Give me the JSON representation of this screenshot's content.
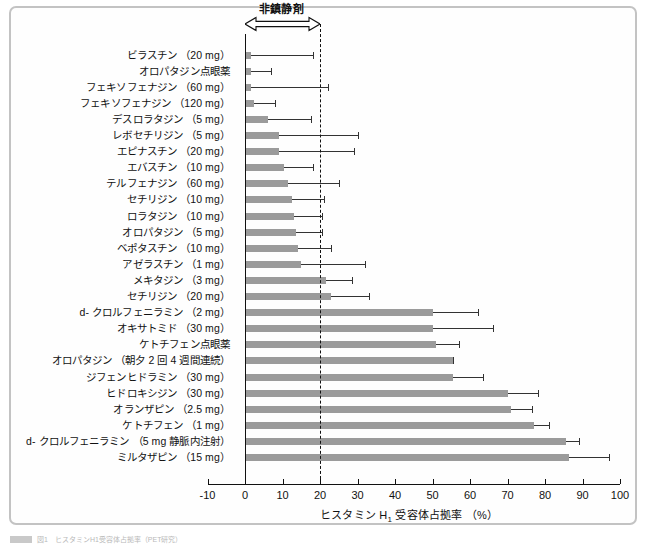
{
  "figure": {
    "arrow_label": "非鎮静剤",
    "xaxis_title_main": "ヒスタミン H",
    "xaxis_title_sub": "1",
    "xaxis_title_rest": " 受容体占拠率 （%）",
    "caption": "図1　ヒスタミンH1受容体占拠率（PET研究）",
    "bar_color": "#9b9b9b",
    "error_color": "#333333",
    "threshold_value": 20
  },
  "chart_data": {
    "type": "bar",
    "orientation": "horizontal",
    "title": "ヒスタミン H1 受容体占拠率 （%）",
    "xlabel": "ヒスタミン H1 受容体占拠率 （%）",
    "ylabel": "",
    "xlim": [
      -10,
      100
    ],
    "xticks": [
      -10,
      0,
      10,
      20,
      30,
      40,
      50,
      60,
      70,
      80,
      90,
      100
    ],
    "xticklabels": [
      "-10",
      "0",
      "10",
      "20",
      "30",
      "40",
      "50",
      "60",
      "70",
      "80",
      "90",
      "100"
    ],
    "grid": false,
    "legend": false,
    "annotations": [
      {
        "text": "非鎮静剤",
        "type": "double-arrow",
        "x_from": 0,
        "x_to": 20
      },
      {
        "text": "threshold",
        "type": "dashed-vline",
        "x": 20
      }
    ],
    "categories": [
      "ビラスチン （20 mg）",
      "オロパタジン点眼薬",
      "フェキソフェナジン （60 mg）",
      "フェキソフェナジン （120 mg）",
      "デスロラタジン （5 mg）",
      "レボセチリジン （5 mg）",
      "エピナスチン （20 mg）",
      "エバスチン （10 mg）",
      "テルフェナジン （60 mg）",
      "セチリジン （10 mg）",
      "ロラタジン （10 mg）",
      "オロパタジン （5 mg）",
      "ベポタスチン （10 mg）",
      "アゼラスチン （1 mg）",
      "メキタジン （3 mg）",
      "セチリジン （20 mg）",
      "d- クロルフェニラミン （2 mg）",
      "オキサトミド （30 mg）",
      "ケトチフェン点眼薬",
      "オロパタジン （朝夕 2 回 4 週間連続）",
      "ジフェンヒドラミン （30 mg）",
      "ヒドロキシジン （30 mg）",
      "オランザピン （2.5 mg）",
      "ケトチフェン （1 mg）",
      "d- クロルフェニラミン （5 mg 静脈内注射）",
      "ミルタザピン （15 mg）"
    ],
    "values": [
      1.5,
      1.5,
      1.5,
      2.5,
      6.0,
      9.0,
      9.0,
      10.5,
      11.5,
      12.5,
      13.0,
      13.5,
      14.0,
      15.0,
      21.5,
      23.0,
      50.0,
      50.0,
      51.0,
      55.5,
      55.5,
      70.0,
      71.0,
      77.0,
      85.5,
      86.5
    ],
    "errors_upper": [
      18.0,
      7.0,
      22.0,
      8.0,
      17.5,
      30.0,
      29.0,
      18.0,
      25.0,
      21.0,
      20.5,
      20.5,
      23.0,
      32.0,
      28.5,
      33.0,
      62.0,
      66.0,
      57.0,
      55.5,
      63.5,
      78.0,
      76.5,
      81.0,
      89.0,
      97.0
    ]
  }
}
